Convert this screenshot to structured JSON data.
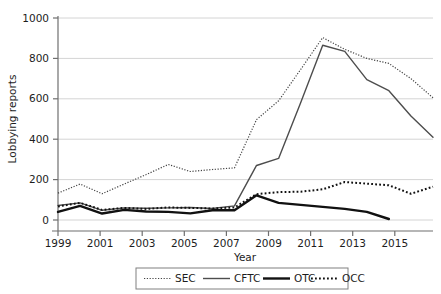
{
  "chart_data": {
    "type": "line",
    "title": "",
    "xlabel": "Year",
    "ylabel": "Lobbying reports",
    "xlim": [
      1999,
      2016
    ],
    "ylim": [
      0,
      1000
    ],
    "xticks": [
      1999,
      2001,
      2003,
      2005,
      2007,
      2009,
      2011,
      2013,
      2015
    ],
    "yticks": [
      0,
      200,
      400,
      600,
      800,
      1000
    ],
    "grid": "horizontal",
    "legend_position": "bottom",
    "x": [
      1999,
      2000,
      2001,
      2002,
      2003,
      2004,
      2005,
      2006,
      2007,
      2008,
      2009,
      2010,
      2011,
      2012,
      2013,
      2014,
      2015,
      2016
    ],
    "series": [
      {
        "name": "SEC",
        "style": "fine-dotted",
        "color": "#444444",
        "values": [
          133,
          178,
          130,
          178,
          225,
          275,
          240,
          250,
          258,
          497,
          590,
          745,
          903,
          845,
          800,
          775,
          700,
          605
        ]
      },
      {
        "name": "CFTC",
        "style": "solid-thin",
        "color": "#4d4d4d",
        "values": [
          72,
          85,
          48,
          60,
          58,
          60,
          62,
          57,
          70,
          270,
          305,
          580,
          865,
          835,
          695,
          640,
          515,
          410
        ]
      },
      {
        "name": "OTC",
        "style": "solid-thick",
        "color": "#111111",
        "values": [
          40,
          70,
          32,
          50,
          42,
          40,
          33,
          48,
          48,
          122,
          85,
          75,
          65,
          55,
          40,
          5,
          null,
          null
        ]
      },
      {
        "name": "OCC",
        "style": "coarse-dotted",
        "color": "#111111",
        "values": [
          67,
          85,
          50,
          60,
          55,
          62,
          60,
          57,
          62,
          128,
          138,
          140,
          152,
          188,
          180,
          172,
          130,
          165
        ]
      }
    ]
  },
  "axis": {
    "ylabel": "Lobbying reports",
    "xlabel": "Year",
    "ytick_labels": [
      "0",
      "200",
      "400",
      "600",
      "800",
      "1000"
    ],
    "xtick_labels": [
      "1999",
      "2001",
      "2003",
      "2005",
      "2007",
      "2009",
      "2011",
      "2013",
      "2015"
    ]
  },
  "legend": {
    "items": [
      {
        "label": "SEC"
      },
      {
        "label": "CFTC"
      },
      {
        "label": "OTC"
      },
      {
        "label": "OCC"
      }
    ]
  },
  "colors": {
    "grid": "#d4d4d4",
    "axis": "#6f6f6f",
    "sec": "#444444",
    "cftc": "#4d4d4d",
    "otc": "#111111",
    "occ": "#111111",
    "legend_border": "#808080"
  }
}
